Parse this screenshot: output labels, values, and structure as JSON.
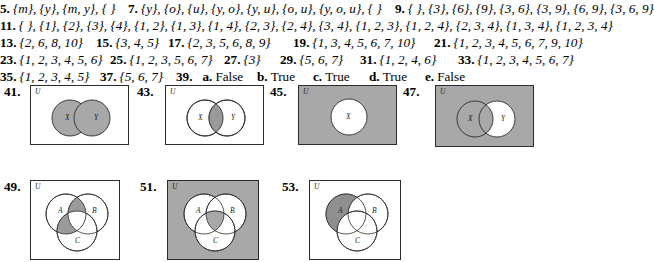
{
  "page": {
    "type": "answer-key",
    "shade_color": "#a8a8a8",
    "shade_color_dark": "#9a9a9a",
    "white": "#ffffff",
    "stroke": "#2b2b2b"
  },
  "answers": [
    {
      "items": [
        {
          "num": "5.",
          "value": "{m}, {y}, {m, y}, { }",
          "x": 0
        },
        {
          "num": "7.",
          "value": "{y}, {o}, {u}, {y, o}, {y, u}, {o, u}, {y, o, u}, { }",
          "x": 128
        },
        {
          "num": "9.",
          "value": "{ }, {3}, {6}, {9}, {3, 6}, {3, 9}, {6, 9}, {3, 6, 9}",
          "x": 395
        }
      ]
    },
    {
      "items": [
        {
          "num": "11.",
          "value": "{ }, {1}, {2}, {3}, {4}, {1, 2}, {1, 3}, {1, 4}, {2, 3}, {2, 4}, {3, 4}, {1, 2, 3}, {1, 2, 4}, {2, 3, 4}, {1, 3, 4}, {1, 2, 3, 4}",
          "x": 0
        }
      ]
    },
    {
      "items": [
        {
          "num": "13.",
          "value": "{2, 6, 8, 10}",
          "x": 0
        },
        {
          "num": "15.",
          "value": "{3, 4, 5}",
          "x": 96
        },
        {
          "num": "17.",
          "value": "{2, 3, 5, 6, 8, 9}",
          "x": 168
        },
        {
          "num": "19.",
          "value": "{1, 3, 4, 5, 6, 7, 10}",
          "x": 293
        },
        {
          "num": "21.",
          "value": "{1, 2, 3, 4, 5, 6, 7, 9, 10}",
          "x": 434
        }
      ]
    },
    {
      "items": [
        {
          "num": "23.",
          "value": "{1, 2, 3, 4, 5, 6}",
          "x": 0
        },
        {
          "num": "25.",
          "value": "{1, 2, 3, 5, 6, 7}",
          "x": 110
        },
        {
          "num": "27.",
          "value": "{3}",
          "x": 224
        },
        {
          "num": "29.",
          "value": "{5, 6, 7}",
          "x": 280
        },
        {
          "num": "31.",
          "value": "{1, 2, 4, 6}",
          "x": 360
        },
        {
          "num": "33.",
          "value": "{1, 2, 3, 4, 5, 6, 7}",
          "x": 458
        }
      ]
    },
    {
      "items": [
        {
          "num": "35.",
          "value": "{1, 2, 3, 4, 5}",
          "x": 0
        },
        {
          "num": "37.",
          "value": "{5, 6, 7}",
          "x": 100
        },
        {
          "num": "39.",
          "sub": "a.",
          "tf": "False",
          "x": 176
        },
        {
          "sub": "b.",
          "tf": "True",
          "x": 250
        },
        {
          "sub": "c.",
          "tf": "True",
          "x": 306
        },
        {
          "sub": "d.",
          "tf": "True",
          "x": 362
        },
        {
          "sub": "e.",
          "tf": "False",
          "x": 418
        }
      ]
    }
  ],
  "diagrams": [
    {
      "num": "41.",
      "universe_label": "U",
      "kind": "two-circle",
      "shaded_regions": "X union Y",
      "box_fill": "#ffffff",
      "labels": [
        "X",
        "Y"
      ]
    },
    {
      "num": "43.",
      "universe_label": "U",
      "kind": "two-circle",
      "shaded_regions": "X intersect Y",
      "box_fill": "#ffffff",
      "labels": [
        "X",
        "Y"
      ]
    },
    {
      "num": "45.",
      "universe_label": "U",
      "kind": "one-circle",
      "shaded_regions": "complement of X",
      "box_fill": "#a8a8a8",
      "labels": [
        "X"
      ]
    },
    {
      "num": "47.",
      "universe_label": "U",
      "kind": "two-circle",
      "shaded_regions": "complement of Y minus X",
      "box_fill": "#a8a8a8",
      "labels": [
        "X",
        "Y"
      ]
    },
    {
      "num": "49.",
      "universe_label": "U",
      "kind": "three-circle",
      "shaded_regions": "A intersect B, A intersect C, minus triple",
      "box_fill": "#ffffff",
      "labels": [
        "A",
        "B",
        "C"
      ]
    },
    {
      "num": "51.",
      "universe_label": "U",
      "kind": "three-circle",
      "shaded_regions": "complement of union, plus triple intersection",
      "box_fill": "#a8a8a8",
      "labels": [
        "A",
        "B",
        "C"
      ]
    },
    {
      "num": "53.",
      "universe_label": "U",
      "kind": "three-circle",
      "shaded_regions": "A only",
      "box_fill": "#ffffff",
      "labels": [
        "A",
        "B",
        "C"
      ]
    }
  ]
}
